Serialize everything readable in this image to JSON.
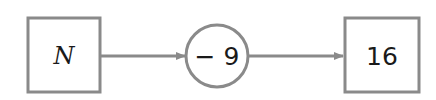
{
  "diagram": {
    "type": "function-machine",
    "input": {
      "label": "N",
      "shape": "square"
    },
    "operation": {
      "label": "− 9",
      "shape": "circle"
    },
    "output": {
      "label": "16",
      "shape": "square"
    },
    "edges": [
      {
        "from": "input",
        "to": "operation"
      },
      {
        "from": "operation",
        "to": "output"
      }
    ]
  },
  "colors": {
    "stroke": "#8a8a8a",
    "text": "#1a1a1a",
    "background": "#ffffff"
  }
}
